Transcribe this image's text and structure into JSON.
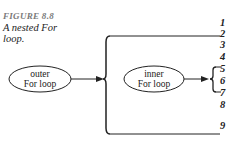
{
  "figure": {
    "label": "FIGURE 8.8",
    "caption": "A nested For loop."
  },
  "nodes": {
    "outer": {
      "line1": "outer",
      "line2": "For loop"
    },
    "inner": {
      "line1": "inner",
      "line2": "For loop"
    }
  },
  "line_numbers": [
    "1",
    "2",
    "3",
    "4",
    "5",
    "6",
    "7",
    "8",
    "9"
  ],
  "colors": {
    "stroke": "#222222",
    "label_gray": "#7a7a7a"
  }
}
